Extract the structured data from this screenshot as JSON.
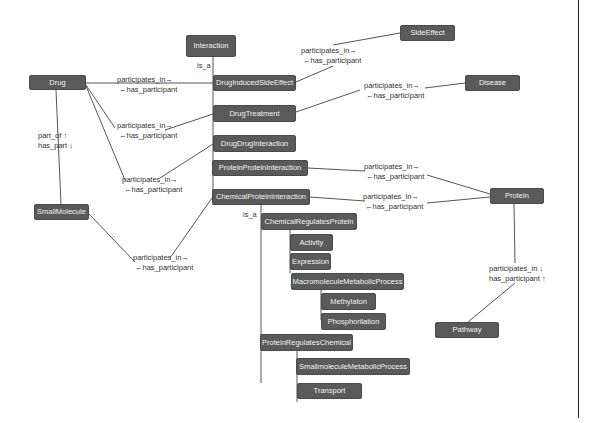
{
  "diagram": {
    "nodes": {
      "interaction": "Interaction",
      "drug": "Drug",
      "small_molecule": "SmallMolecule",
      "drug_induced_side_effect": "DrugInducedSideEffect",
      "drug_treatment": "DrugTreatment",
      "drug_drug_interaction": "DrugDrugInteraction",
      "protein_protein_interaction": "ProteinProteinInteraction",
      "chemical_protein_interaction": "ChemicalProteinInteraction",
      "chemical_regulates_protein": "ChemicalRegulatesProtein",
      "activity": "Activity",
      "expression": "Expression",
      "macromolecule_metabolic_process": "MacromoleculeMetabolicProcess",
      "methylaton": "Methylaton",
      "phosphorilation": "Phosphorilation",
      "protein_regulates_chemical": "ProteinRegulatesChemical",
      "smallmolecule_metabolic_process": "SmallmoleculeMetabolicProcess",
      "transport": "Transport",
      "side_effect": "SideEffect",
      "disease": "Disease",
      "protein": "Protein",
      "pathway": "Pathway"
    },
    "edge_labels": {
      "is_a_top": "is_a",
      "is_a_chem": "is_a",
      "part_of": "part_of ↑",
      "has_part": "has_part ↓",
      "pi": "participates_in→",
      "hp": "←has_participant",
      "pi_down": "participates_in ↓",
      "hp_up": "has_participant  ↑"
    },
    "colors": {
      "node_fill": "#5a5a5a",
      "node_text": "#f2f2f2",
      "edge": "#555555",
      "background": "#ffffff"
    }
  }
}
